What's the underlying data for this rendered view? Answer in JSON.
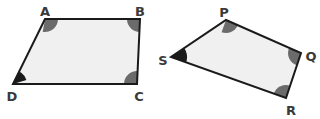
{
  "figure": {
    "background_color": "#ffffff",
    "shapes": [
      {
        "name": "parallelogram-abcd",
        "fill_color": "#f0f0f0",
        "stroke_color": "#1a1a1a",
        "stroke_width": 2,
        "points": "45,19 140,19 137,84 13,84",
        "vertices": [
          {
            "label": "A",
            "x": 45,
            "y": 19,
            "label_x": 45,
            "label_y": 12,
            "angle_color": "#6b6b6b",
            "angle_radius": 13,
            "start_deg": 0,
            "end_deg": 100
          },
          {
            "label": "B",
            "x": 140,
            "y": 19,
            "label_x": 140,
            "label_y": 12,
            "angle_color": "#6b6b6b",
            "angle_radius": 13,
            "start_deg": 90,
            "end_deg": 180
          },
          {
            "label": "C",
            "x": 137,
            "y": 84,
            "label_x": 139,
            "label_y": 97,
            "angle_color": "#6b6b6b",
            "angle_radius": 13,
            "start_deg": 180,
            "end_deg": 272
          },
          {
            "label": "D",
            "x": 13,
            "y": 84,
            "label_x": 12,
            "label_y": 97,
            "angle_color": "#1a1a1a",
            "angle_radius": 14,
            "start_deg": 270,
            "end_deg": 343
          }
        ]
      },
      {
        "name": "parallelogram-pqrs",
        "fill_color": "#f0f0f0",
        "stroke_color": "#1a1a1a",
        "stroke_width": 2,
        "points": "226,20 301,53 286,98 171,57",
        "vertices": [
          {
            "label": "P",
            "x": 226,
            "y": 20,
            "label_x": 224,
            "label_y": 13,
            "angle_color": "#6b6b6b",
            "angle_radius": 13,
            "start_deg": 24,
            "end_deg": 110
          },
          {
            "label": "Q",
            "x": 301,
            "y": 53,
            "label_x": 311,
            "label_y": 57,
            "angle_color": "#6b6b6b",
            "angle_radius": 13,
            "start_deg": 108,
            "end_deg": 204
          },
          {
            "label": "R",
            "x": 286,
            "y": 98,
            "label_x": 291,
            "label_y": 111,
            "angle_color": "#6b6b6b",
            "angle_radius": 13,
            "start_deg": 200,
            "end_deg": 290
          },
          {
            "label": "S",
            "x": 171,
            "y": 57,
            "label_x": 163,
            "label_y": 61,
            "angle_color": "#1a1a1a",
            "angle_radius": 16,
            "start_deg": 294,
            "end_deg": 20
          }
        ]
      }
    ]
  }
}
